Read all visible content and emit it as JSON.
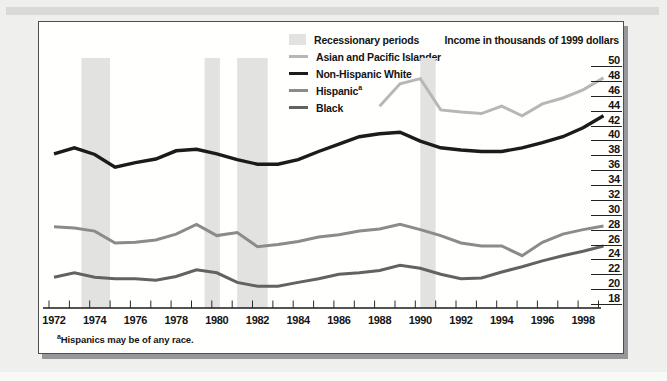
{
  "chart_data": {
    "type": "line",
    "unit_label": "Income in thousands of 1999 dollars",
    "footnote_sup": "a",
    "footnote_text": "Hispanics may be of any race.",
    "x_axis": {
      "start": 1972,
      "end": 1999,
      "tick_labels": [
        "1972",
        "1974",
        "1976",
        "1978",
        "1980",
        "1982",
        "1984",
        "1986",
        "1988",
        "1990",
        "1992",
        "1994",
        "1996",
        "1998"
      ]
    },
    "y_axis": {
      "min": 18,
      "max": 50,
      "tick_step": 2,
      "tick_labels": [
        "50",
        "48",
        "46",
        "44",
        "42",
        "40",
        "38",
        "36",
        "34",
        "32",
        "30",
        "28",
        "26",
        "24",
        "22",
        "20",
        "18"
      ]
    },
    "legend": [
      {
        "label": "Recessionary periods",
        "swatch": "band",
        "color": "#e2e2e0"
      },
      {
        "label": "Asian and Pacific Islander",
        "swatch": "line",
        "color": "#b7b7b5"
      },
      {
        "label": "Non-Hispanic White",
        "swatch": "line",
        "color": "#1b1b1b"
      },
      {
        "label": "Hispanic",
        "label_sup": "a",
        "swatch": "line",
        "color": "#8b8b89"
      },
      {
        "label": "Black",
        "swatch": "line",
        "color": "#62625f"
      }
    ],
    "recession_periods": [
      [
        1973.35,
        1974.75
      ],
      [
        1979.4,
        1980.15
      ],
      [
        1981.0,
        1982.5
      ],
      [
        1990.0,
        1990.75
      ]
    ],
    "series": [
      {
        "name": "Asian and Pacific Islander",
        "color": "#b7b7b5",
        "width": 3,
        "start_year": 1988,
        "values": [
          44.6,
          47.6,
          48.3,
          44.1,
          43.8,
          43.6,
          44.6,
          43.3,
          44.9,
          45.7,
          46.8,
          48.4
        ]
      },
      {
        "name": "Non-Hispanic White",
        "color": "#1b1b1b",
        "width": 3.4,
        "start_year": 1972,
        "values": [
          38.2,
          39.0,
          38.1,
          36.4,
          37.0,
          37.5,
          38.6,
          38.8,
          38.2,
          37.4,
          36.8,
          36.8,
          37.4,
          38.5,
          39.5,
          40.5,
          40.9,
          41.1,
          39.9,
          39.0,
          38.7,
          38.5,
          38.5,
          39.0,
          39.7,
          40.5,
          41.7,
          43.3
        ]
      },
      {
        "name": "Hispanic",
        "color": "#8b8b89",
        "width": 3,
        "start_year": 1972,
        "values": [
          28.4,
          28.2,
          27.8,
          26.2,
          26.3,
          26.6,
          27.4,
          28.7,
          27.2,
          27.6,
          25.7,
          26.0,
          26.4,
          27.0,
          27.3,
          27.8,
          28.1,
          28.7,
          28.0,
          27.2,
          26.2,
          25.8,
          25.8,
          24.5,
          26.3,
          27.4,
          28.0,
          28.5
        ]
      },
      {
        "name": "Black",
        "color": "#62625f",
        "width": 3,
        "start_year": 1972,
        "values": [
          21.6,
          22.2,
          21.6,
          21.4,
          21.4,
          21.2,
          21.7,
          22.6,
          22.2,
          20.9,
          20.4,
          20.4,
          20.9,
          21.4,
          22.0,
          22.2,
          22.5,
          23.2,
          22.8,
          22.0,
          21.4,
          21.5,
          22.3,
          23.0,
          23.8,
          24.5,
          25.1,
          25.8
        ]
      }
    ]
  }
}
